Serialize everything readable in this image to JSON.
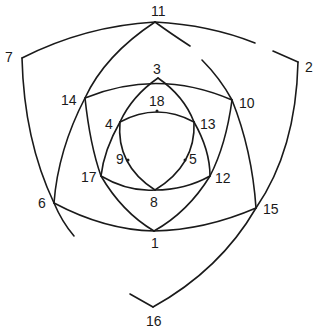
{
  "diagram": {
    "type": "nested curvilinear triangles / vertex-labeled arc figure",
    "labels": {
      "n1": "1",
      "n2": "2",
      "n3": "3",
      "n4": "4",
      "n5": "5",
      "n6": "6",
      "n7": "7",
      "n8": "8",
      "n9": "9",
      "n10": "10",
      "n11": "11",
      "n12": "12",
      "n13": "13",
      "n14": "14",
      "n15": "15",
      "n16": "16",
      "n17": "17",
      "n18": "18"
    },
    "vertices": [
      {
        "id": "1",
        "x": 154,
        "y": 231
      },
      {
        "id": "2",
        "x": 298,
        "y": 62
      },
      {
        "id": "3",
        "x": 158,
        "y": 78
      },
      {
        "id": "4",
        "x": 120,
        "y": 122
      },
      {
        "id": "5",
        "x": 184,
        "y": 158
      },
      {
        "id": "6",
        "x": 54,
        "y": 203
      },
      {
        "id": "7",
        "x": 22,
        "y": 58
      },
      {
        "id": "8",
        "x": 155,
        "y": 190
      },
      {
        "id": "9",
        "x": 128,
        "y": 158
      },
      {
        "id": "10",
        "x": 232,
        "y": 100
      },
      {
        "id": "11",
        "x": 155,
        "y": 22
      },
      {
        "id": "12",
        "x": 210,
        "y": 176
      },
      {
        "id": "13",
        "x": 194,
        "y": 122
      },
      {
        "id": "14",
        "x": 85,
        "y": 98
      },
      {
        "id": "15",
        "x": 256,
        "y": 208
      },
      {
        "id": "16",
        "x": 153,
        "y": 307
      },
      {
        "id": "17",
        "x": 101,
        "y": 176
      },
      {
        "id": "18",
        "x": 157,
        "y": 111
      }
    ],
    "stroke_color": "#1a1a1a",
    "background_color": "#ffffff"
  }
}
